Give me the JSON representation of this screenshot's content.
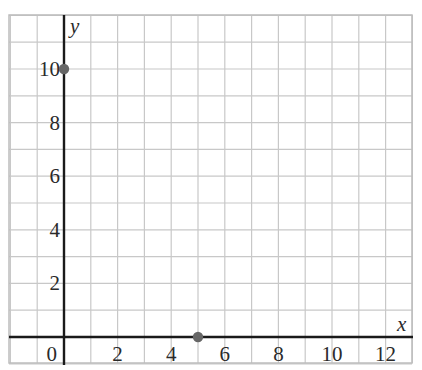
{
  "chart_data": {
    "type": "scatter",
    "title": "",
    "xlabel": "x",
    "ylabel": "y",
    "xlim": [
      -2,
      13
    ],
    "ylim": [
      -1,
      12
    ],
    "grid": true,
    "x_ticks": [
      0,
      2,
      4,
      6,
      8,
      10,
      12
    ],
    "y_ticks": [
      2,
      4,
      6,
      8,
      10
    ],
    "series": [
      {
        "name": "points",
        "points": [
          {
            "x": 0,
            "y": 10
          },
          {
            "x": 5,
            "y": 0
          }
        ],
        "color": "#666666"
      }
    ],
    "legend": null
  },
  "colors": {
    "grid": "#c8c8c8",
    "axis": "#1a1a1a",
    "point": "#666666",
    "text": "#2a2a2a"
  }
}
